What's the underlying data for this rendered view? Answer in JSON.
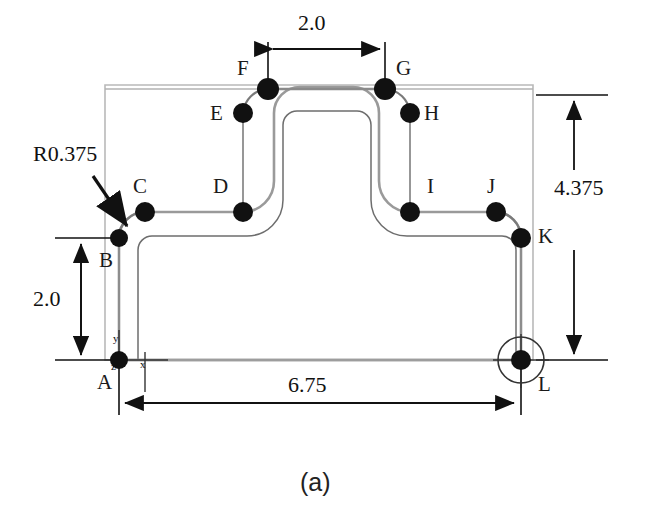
{
  "figure": {
    "caption": "(a)",
    "type": "engineering-drawing"
  },
  "dimensions": [
    {
      "name": "top-width",
      "value": "2.0",
      "orientation": "horizontal",
      "between": [
        "F",
        "G"
      ]
    },
    {
      "name": "overall-height",
      "value": "4.375",
      "orientation": "vertical",
      "between": [
        "top-edge",
        "A-level"
      ]
    },
    {
      "name": "base-height",
      "value": "2.0",
      "orientation": "vertical",
      "between": [
        "A",
        "B"
      ]
    },
    {
      "name": "overall-width",
      "value": "6.75",
      "orientation": "horizontal",
      "between": [
        "A",
        "L"
      ]
    }
  ],
  "radius_note": {
    "label": "R0.375",
    "points_to": "fillet between B and C"
  },
  "axes": {
    "x": "x",
    "y": "y",
    "z": "z",
    "origin_point": "A"
  },
  "points": [
    {
      "id": "A",
      "label": "A",
      "cx": 119,
      "cy": 360,
      "lx": 97,
      "ly": 372,
      "r": 9,
      "circled": false
    },
    {
      "id": "B",
      "label": "B",
      "cx": 119,
      "cy": 238,
      "lx": 99,
      "ly": 250,
      "r": 9,
      "circled": false
    },
    {
      "id": "C",
      "label": "C",
      "cx": 145,
      "cy": 212,
      "lx": 133,
      "ly": 176,
      "r": 10,
      "circled": false
    },
    {
      "id": "D",
      "label": "D",
      "cx": 243,
      "cy": 212,
      "lx": 213,
      "ly": 176,
      "r": 10,
      "circled": false
    },
    {
      "id": "E",
      "label": "E",
      "cx": 243,
      "cy": 113,
      "lx": 210,
      "ly": 103,
      "r": 10,
      "circled": false
    },
    {
      "id": "F",
      "label": "F",
      "cx": 268,
      "cy": 89,
      "lx": 237,
      "ly": 58,
      "r": 11,
      "circled": false
    },
    {
      "id": "G",
      "label": "G",
      "cx": 385,
      "cy": 89,
      "lx": 396,
      "ly": 58,
      "r": 11,
      "circled": false
    },
    {
      "id": "H",
      "label": "H",
      "cx": 410,
      "cy": 113,
      "lx": 424,
      "ly": 103,
      "r": 10,
      "circled": false
    },
    {
      "id": "I",
      "label": "I",
      "cx": 410,
      "cy": 212,
      "lx": 427,
      "ly": 176,
      "r": 10,
      "circled": false
    },
    {
      "id": "J",
      "label": "J",
      "cx": 496,
      "cy": 212,
      "lx": 487,
      "ly": 176,
      "r": 10,
      "circled": false
    },
    {
      "id": "K",
      "label": "K",
      "cx": 521,
      "cy": 238,
      "lx": 538,
      "ly": 226,
      "r": 10,
      "circled": false
    },
    {
      "id": "L",
      "label": "L",
      "cx": 521,
      "cy": 360,
      "lx": 538,
      "ly": 374,
      "r": 10,
      "circled": true
    }
  ],
  "colors": {
    "profile": "#8a8a8a",
    "profile_dark": "#555555",
    "marker": "#111111",
    "dimension": "#111111",
    "envelope": "#b8b8b8"
  }
}
